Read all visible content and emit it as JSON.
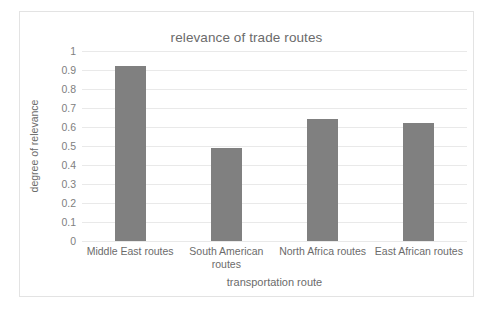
{
  "chart_data": {
    "type": "bar",
    "title": "relevance of trade routes",
    "xlabel": "transportation route",
    "ylabel": "degree of relevance",
    "categories": [
      "Middle East routes",
      "South American routes",
      "North Africa routes",
      "East African routes"
    ],
    "values": [
      0.92,
      0.49,
      0.64,
      0.62
    ],
    "ylim": [
      0,
      1
    ],
    "ytick_labels": [
      "1",
      "0.9",
      "0.8",
      "0.7",
      "0.6",
      "0.5",
      "0.4",
      "0.3",
      "0.2",
      "0.1",
      "0"
    ],
    "ytick_values": [
      1,
      0.9,
      0.8,
      0.7,
      0.6,
      0.5,
      0.4,
      0.3,
      0.2,
      0.1,
      0
    ],
    "grid": "horizontal",
    "legend": "none",
    "bar_color": "#808080",
    "gridline_color": "#e9e9e9",
    "text_color": "#6b6b6b",
    "background_color": "#ffffff",
    "border_color": "#e3e3e3"
  }
}
